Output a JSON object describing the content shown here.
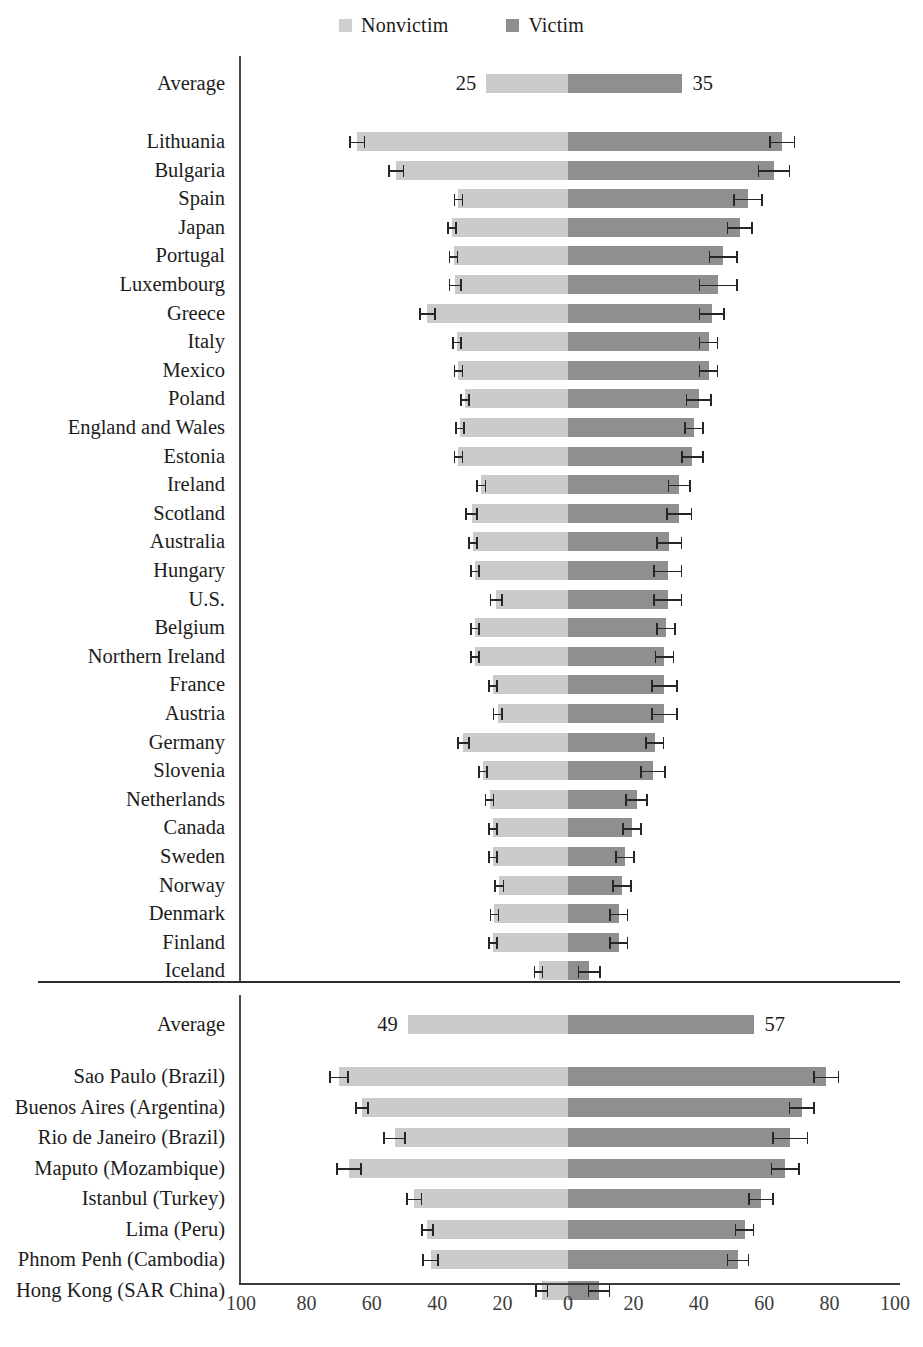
{
  "legend": {
    "entries": [
      {
        "label": "Nonvictim",
        "color": "#cfcfcf",
        "icon": "square-swatch-icon"
      },
      {
        "label": "Victim",
        "color": "#8e8e8e",
        "icon": "square-swatch-icon"
      }
    ]
  },
  "axis": {
    "ticks": [
      "100",
      "80",
      "60",
      "40",
      "20",
      "0",
      "20",
      "40",
      "60",
      "80",
      "100"
    ],
    "tick_values": [
      -100,
      -80,
      -60,
      -40,
      -20,
      0,
      20,
      40,
      60,
      80,
      100
    ],
    "min": -100,
    "max": 100
  },
  "chart_data": {
    "type": "bar",
    "orientation": "horizontal",
    "style": "diverging-paired-bar",
    "title": "",
    "xlabel": "",
    "ylabel": "",
    "xlim": [
      -100,
      100
    ],
    "grid": false,
    "legend_position": "top-center",
    "series": [
      {
        "name": "Nonvictim",
        "color": "#cfcfcf",
        "side": "left"
      },
      {
        "name": "Victim",
        "color": "#8e8e8e",
        "side": "right"
      }
    ],
    "panels": [
      {
        "name": "countries",
        "average_row": {
          "label": "Average",
          "nonvictim": 25,
          "victim": 35,
          "nonvictim_label": "25",
          "victim_label": "35",
          "error_bars": false
        },
        "categories": [
          "Lithuania",
          "Bulgaria",
          "Spain",
          "Japan",
          "Portugal",
          "Luxembourg",
          "Greece",
          "Italy",
          "Mexico",
          "Poland",
          "England and Wales",
          "Estonia",
          "Ireland",
          "Scotland",
          "Australia",
          "Hungary",
          "U.S.",
          "Belgium",
          "Northern Ireland",
          "France",
          "Austria",
          "Germany",
          "Slovenia",
          "Netherlands",
          "Canada",
          "Sweden",
          "Norway",
          "Denmark",
          "Finland",
          "Iceland"
        ],
        "nonvictim": [
          64.5,
          52.5,
          33.5,
          35.5,
          35.0,
          34.5,
          43.0,
          34.0,
          33.5,
          31.5,
          33.0,
          33.5,
          26.5,
          29.5,
          29.0,
          28.5,
          22.0,
          28.5,
          28.5,
          23.0,
          21.5,
          32.0,
          26.0,
          24.0,
          23.0,
          23.0,
          21.0,
          22.5,
          23.0,
          9.0
        ],
        "victim": [
          65.5,
          63.0,
          55.0,
          52.5,
          47.5,
          46.0,
          44.0,
          43.0,
          43.0,
          40.0,
          38.5,
          38.0,
          34.0,
          34.0,
          31.0,
          30.5,
          30.5,
          30.0,
          29.5,
          29.5,
          29.5,
          26.5,
          26.0,
          21.0,
          19.5,
          17.5,
          16.5,
          15.5,
          15.5,
          6.5
        ],
        "nonvictim_err": [
          2.5,
          2.5,
          1.5,
          1.5,
          1.5,
          2.0,
          2.5,
          1.5,
          1.5,
          1.5,
          1.5,
          1.5,
          1.5,
          2.0,
          1.5,
          1.5,
          2.0,
          1.5,
          1.5,
          1.5,
          1.5,
          2.0,
          1.5,
          1.5,
          1.5,
          1.5,
          1.5,
          1.5,
          1.5,
          1.5
        ],
        "victim_err": [
          4.0,
          5.0,
          4.5,
          4.0,
          4.5,
          6.0,
          4.0,
          3.0,
          3.0,
          4.0,
          3.0,
          3.5,
          3.5,
          4.0,
          4.0,
          4.5,
          4.5,
          3.0,
          3.0,
          4.0,
          4.0,
          3.0,
          4.0,
          3.5,
          3.0,
          3.0,
          3.0,
          3.0,
          3.0,
          3.5
        ]
      },
      {
        "name": "cities",
        "average_row": {
          "label": "Average",
          "nonvictim": 49,
          "victim": 57,
          "nonvictim_label": "49",
          "victim_label": "57",
          "error_bars": false
        },
        "categories": [
          "Sao Paulo (Brazil)",
          "Buenos Aires (Argentina)",
          "Rio de Janeiro (Brazil)",
          "Maputo (Mozambique)",
          "Istanbul (Turkey)",
          "Lima (Peru)",
          "Phnom Penh (Cambodia)",
          "Hong Kong (SAR China)"
        ],
        "nonvictim": [
          70.0,
          63.0,
          53.0,
          67.0,
          47.0,
          43.0,
          42.0,
          8.0
        ],
        "victim": [
          79.0,
          71.5,
          68.0,
          66.5,
          59.0,
          54.0,
          52.0,
          9.5
        ],
        "nonvictim_err": [
          3.0,
          2.0,
          3.5,
          4.0,
          2.5,
          2.0,
          2.5,
          2.0
        ],
        "victim_err": [
          4.0,
          4.0,
          5.5,
          4.5,
          4.0,
          3.0,
          3.5,
          3.5
        ]
      }
    ]
  }
}
